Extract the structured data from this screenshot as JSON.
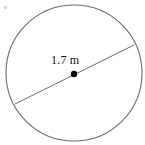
{
  "figure": {
    "kind": "circle-diameter-diagram",
    "background_color": "#ffffff",
    "circle": {
      "name": "circle-outline",
      "center_x": 74,
      "center_y": 73,
      "radius": 68,
      "stroke_color": "#6a6a70",
      "stroke_width": 1.1,
      "fill_color": "none"
    },
    "diameter": {
      "name": "diameter-segment",
      "x1": 15,
      "y1": 104,
      "x2": 134,
      "y2": 45,
      "stroke_color": "#6a6a70",
      "stroke_width": 1.0
    },
    "center_point": {
      "name": "center-dot",
      "cx": 74,
      "cy": 74,
      "radius": 3.2,
      "fill_color": "#000000"
    },
    "label": {
      "name": "diameter-measure-label",
      "text": "1.7 m",
      "value": "1.7",
      "unit": "m",
      "color": "#111114"
    },
    "artifact": {
      "name": "scan-speck",
      "color": "#d8d8dc"
    }
  },
  "chart_data": {
    "type": "diagram",
    "title": "",
    "shape": "circle",
    "annotations": [
      {
        "label": "1.7 m",
        "measures": "diameter",
        "value": 1.7,
        "unit": "m"
      }
    ],
    "elements": [
      "circle-outline",
      "diameter-segment",
      "center-dot",
      "diameter-measure-label"
    ]
  }
}
